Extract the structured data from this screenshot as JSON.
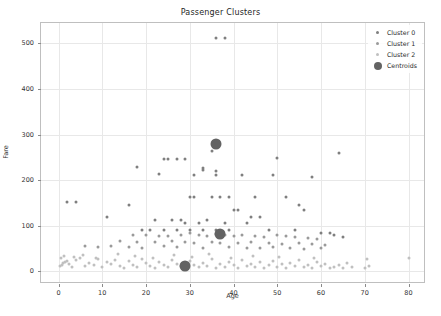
{
  "chart_data": {
    "type": "scatter",
    "title": "Passenger Clusters",
    "xlabel": "Age",
    "ylabel": "Fare",
    "xlim": [
      -4,
      84
    ],
    "ylim": [
      -28,
      545
    ],
    "xticks": [
      0,
      10,
      20,
      30,
      40,
      50,
      60,
      70,
      80
    ],
    "yticks": [
      0,
      100,
      200,
      300,
      400,
      500
    ],
    "grid": true,
    "legend_position": "upper right",
    "legend": [
      "Cluster 0",
      "Cluster 1",
      "Cluster 2",
      "Centroids"
    ],
    "colors": {
      "cluster0": "#7f7f7f",
      "cluster1": "#9a9a9a",
      "cluster2": "#c0c0c0",
      "centroid": "#636363",
      "grid": "#e8e8e8",
      "frame": "#bfbfbf",
      "background": "#ffffff"
    },
    "series": [
      {
        "name": "Cluster 0",
        "marker": "circle",
        "color": "#7f7f7f",
        "points": [
          [
            36,
            512
          ],
          [
            38,
            512
          ],
          [
            35,
            263
          ],
          [
            64,
            260
          ],
          [
            50,
            248
          ],
          [
            24,
            247
          ],
          [
            25,
            247
          ],
          [
            27,
            247
          ],
          [
            29,
            247
          ],
          [
            33,
            227
          ],
          [
            33,
            222
          ],
          [
            36,
            221
          ],
          [
            36,
            211
          ],
          [
            31,
            211
          ],
          [
            18,
            228
          ],
          [
            23,
            214
          ],
          [
            42,
            211
          ],
          [
            49,
            211
          ],
          [
            58,
            208
          ],
          [
            2,
            151
          ],
          [
            4,
            151
          ],
          [
            16,
            146
          ],
          [
            11,
            120
          ],
          [
            30,
            164
          ],
          [
            31,
            164
          ],
          [
            35,
            164
          ],
          [
            37,
            164
          ],
          [
            39,
            164
          ],
          [
            45,
            164
          ],
          [
            52,
            164
          ],
          [
            55,
            146
          ],
          [
            56,
            134
          ],
          [
            40,
            134
          ],
          [
            41,
            134
          ],
          [
            44,
            120
          ],
          [
            46,
            120
          ],
          [
            22,
            113
          ],
          [
            26,
            113
          ],
          [
            28,
            113
          ],
          [
            34,
            113
          ],
          [
            29,
            106
          ],
          [
            32,
            106
          ],
          [
            38,
            106
          ],
          [
            43,
            106
          ],
          [
            19,
            91
          ],
          [
            21,
            91
          ],
          [
            24,
            91
          ],
          [
            27,
            91
          ],
          [
            30,
            91
          ],
          [
            33,
            91
          ],
          [
            36,
            91
          ],
          [
            39,
            91
          ],
          [
            48,
            91
          ],
          [
            54,
            91
          ],
          [
            60,
            83
          ],
          [
            62,
            83
          ],
          [
            63,
            80
          ],
          [
            65,
            76
          ]
        ]
      },
      {
        "name": "Cluster 1",
        "marker": "circle",
        "color": "#9a9a9a",
        "points": [
          [
            17,
            80
          ],
          [
            20,
            79
          ],
          [
            23,
            78
          ],
          [
            25,
            77
          ],
          [
            28,
            80
          ],
          [
            30,
            83
          ],
          [
            32,
            80
          ],
          [
            34,
            78
          ],
          [
            36,
            82
          ],
          [
            38,
            79
          ],
          [
            40,
            77
          ],
          [
            42,
            80
          ],
          [
            45,
            78
          ],
          [
            47,
            76
          ],
          [
            50,
            79
          ],
          [
            52,
            77
          ],
          [
            54,
            75
          ],
          [
            57,
            73
          ],
          [
            59,
            71
          ],
          [
            14,
            66
          ],
          [
            18,
            65
          ],
          [
            22,
            64
          ],
          [
            26,
            66
          ],
          [
            29,
            64
          ],
          [
            31,
            62
          ],
          [
            35,
            65
          ],
          [
            37,
            63
          ],
          [
            41,
            61
          ],
          [
            44,
            64
          ],
          [
            48,
            62
          ],
          [
            51,
            60
          ],
          [
            55,
            62
          ],
          [
            58,
            59
          ],
          [
            61,
            57
          ],
          [
            6,
            55
          ],
          [
            9,
            53
          ],
          [
            12,
            56
          ],
          [
            16,
            54
          ],
          [
            19,
            52
          ],
          [
            24,
            55
          ],
          [
            27,
            53
          ],
          [
            33,
            51
          ],
          [
            39,
            54
          ],
          [
            43,
            52
          ],
          [
            46,
            50
          ],
          [
            49,
            53
          ],
          [
            53,
            51
          ],
          [
            56,
            49
          ],
          [
            60,
            52
          ]
        ]
      },
      {
        "name": "Cluster 2",
        "marker": "circle",
        "color": "#c0c0c0",
        "points": [
          [
            0.4,
            12
          ],
          [
            0.8,
            14
          ],
          [
            1,
            18
          ],
          [
            1.5,
            20
          ],
          [
            2,
            22
          ],
          [
            2.5,
            16
          ],
          [
            3,
            10
          ],
          [
            4,
            24
          ],
          [
            5,
            28
          ],
          [
            6,
            12
          ],
          [
            7,
            18
          ],
          [
            8,
            14
          ],
          [
            9,
            26
          ],
          [
            10,
            10
          ],
          [
            11,
            20
          ],
          [
            12,
            16
          ],
          [
            13,
            24
          ],
          [
            14,
            12
          ],
          [
            15,
            8
          ],
          [
            16,
            22
          ],
          [
            17,
            14
          ],
          [
            18,
            10
          ],
          [
            19,
            26
          ],
          [
            20,
            18
          ],
          [
            21,
            12
          ],
          [
            22,
            8
          ],
          [
            23,
            20
          ],
          [
            24,
            14
          ],
          [
            25,
            10
          ],
          [
            26,
            24
          ],
          [
            27,
            16
          ],
          [
            28,
            12
          ],
          [
            29,
            8
          ],
          [
            30,
            22
          ],
          [
            31,
            14
          ],
          [
            32,
            10
          ],
          [
            33,
            18
          ],
          [
            34,
            12
          ],
          [
            35,
            26
          ],
          [
            36,
            8
          ],
          [
            37,
            16
          ],
          [
            38,
            10
          ],
          [
            39,
            20
          ],
          [
            40,
            14
          ],
          [
            41,
            8
          ],
          [
            42,
            24
          ],
          [
            43,
            12
          ],
          [
            44,
            16
          ],
          [
            45,
            10
          ],
          [
            46,
            20
          ],
          [
            47,
            8
          ],
          [
            48,
            14
          ],
          [
            49,
            22
          ],
          [
            50,
            10
          ],
          [
            51,
            16
          ],
          [
            52,
            8
          ],
          [
            53,
            18
          ],
          [
            54,
            12
          ],
          [
            55,
            24
          ],
          [
            56,
            10
          ],
          [
            57,
            14
          ],
          [
            58,
            8
          ],
          [
            59,
            20
          ],
          [
            60,
            12
          ],
          [
            61,
            16
          ],
          [
            62,
            8
          ],
          [
            63,
            10
          ],
          [
            64,
            14
          ],
          [
            65,
            8
          ],
          [
            66,
            18
          ],
          [
            67,
            10
          ],
          [
            70,
            8
          ],
          [
            70.5,
            26
          ],
          [
            71,
            12
          ],
          [
            80,
            30
          ],
          [
            0.5,
            28
          ],
          [
            1.2,
            34
          ],
          [
            3.5,
            32
          ],
          [
            5.5,
            36
          ],
          [
            8.5,
            30
          ],
          [
            13.5,
            38
          ],
          [
            17.5,
            34
          ],
          [
            21.5,
            30
          ],
          [
            26.5,
            36
          ],
          [
            30.5,
            32
          ],
          [
            34.5,
            38
          ],
          [
            39.5,
            30
          ],
          [
            44.5,
            34
          ],
          [
            50.5,
            32
          ],
          [
            58.5,
            30
          ]
        ]
      },
      {
        "name": "Centroids",
        "marker": "large-circle",
        "color": "#636363",
        "points": [
          [
            36,
            280
          ],
          [
            37,
            82
          ],
          [
            29,
            12
          ]
        ]
      }
    ]
  }
}
